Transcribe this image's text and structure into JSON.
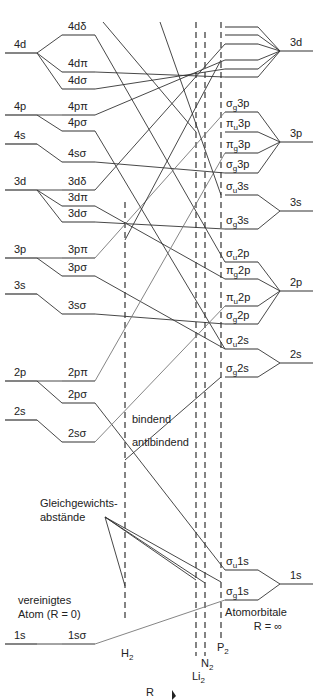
{
  "diagram": {
    "left_header": "vereinigtes Atom (R = 0)",
    "left_header_lines": [
      "vereinigtes",
      "Atom (R = 0)"
    ],
    "right_header_lines": [
      "Atomorbitale",
      "R = ∞"
    ],
    "axis_label": "R",
    "bonding_label": "bindend",
    "antibonding_label": "antibindend",
    "equilibrium_label_lines": [
      "Gleichgewichts-",
      "abstände"
    ],
    "molecules": [
      {
        "name": "H",
        "sub": "2",
        "x": 125,
        "y_top": 202,
        "y_bottom": 622,
        "label_y": 657
      },
      {
        "name": "Li",
        "sub": "2",
        "x": 196,
        "y_top": 22,
        "y_bottom": 656,
        "label_y": 680
      },
      {
        "name": "N",
        "sub": "2",
        "x": 205,
        "y_top": 32,
        "y_bottom": 656,
        "label_y": 667
      },
      {
        "name": "P",
        "sub": "2",
        "x": 221,
        "y_top": 22,
        "y_bottom": 640,
        "label_y": 651
      }
    ],
    "united_atom_levels": [
      {
        "label": "4d",
        "y": 53
      },
      {
        "label": "4p",
        "y": 115
      },
      {
        "label": "4s",
        "y": 144
      },
      {
        "label": "3d",
        "y": 190
      },
      {
        "label": "3p",
        "y": 258
      },
      {
        "label": "3s",
        "y": 294
      },
      {
        "label": "2p",
        "y": 381
      },
      {
        "label": "2s",
        "y": 420
      },
      {
        "label": "1s",
        "y": 644
      }
    ],
    "united_mo_levels": [
      {
        "label": "4dδ",
        "y": 35,
        "parent_y": 53
      },
      {
        "label": "4dπ",
        "y": 72,
        "parent_y": 53
      },
      {
        "label": "4dσ",
        "y": 89,
        "parent_y": 53
      },
      {
        "label": "4pπ",
        "y": 115,
        "parent_y": 115
      },
      {
        "label": "4pσ",
        "y": 131,
        "parent_y": 115
      },
      {
        "label": "4sσ",
        "y": 162,
        "parent_y": 144
      },
      {
        "label": "3dδ",
        "y": 190,
        "parent_y": 190
      },
      {
        "label": "3dπ",
        "y": 206,
        "parent_y": 190
      },
      {
        "label": "3dσ",
        "y": 222,
        "parent_y": 190
      },
      {
        "label": "3pπ",
        "y": 258,
        "parent_y": 258
      },
      {
        "label": "3pσ",
        "y": 276,
        "parent_y": 258
      },
      {
        "label": "3sσ",
        "y": 314,
        "parent_y": 294
      },
      {
        "label": "2pπ",
        "y": 381,
        "parent_y": 381
      },
      {
        "label": "2pσ",
        "y": 403,
        "parent_y": 381
      },
      {
        "label": "2sσ",
        "y": 442,
        "parent_y": 420
      },
      {
        "label": "1sσ",
        "y": 644,
        "parent_y": 644
      }
    ],
    "separated_atom_levels": [
      {
        "label": "3d",
        "y": 51
      },
      {
        "label": "3p",
        "y": 142
      },
      {
        "label": "3s",
        "y": 211
      },
      {
        "label": "2p",
        "y": 291
      },
      {
        "label": "2s",
        "y": 363
      },
      {
        "label": "1s",
        "y": 584
      }
    ],
    "separated_mo_levels": [
      {
        "sym": "",
        "sub": "",
        "orb": "",
        "y": 27,
        "parent_y": 51
      },
      {
        "sym": "",
        "sub": "",
        "orb": "",
        "y": 35,
        "parent_y": 51
      },
      {
        "sym": "",
        "sub": "",
        "orb": "",
        "y": 44,
        "parent_y": 51
      },
      {
        "sym": "",
        "sub": "",
        "orb": "",
        "y": 60,
        "parent_y": 51
      },
      {
        "sym": "",
        "sub": "",
        "orb": "",
        "y": 69,
        "parent_y": 51
      },
      {
        "sym": "",
        "sub": "",
        "orb": "",
        "y": 77,
        "parent_y": 51
      },
      {
        "sym": "σ",
        "sub": "g",
        "orb": "3p",
        "y": 112,
        "parent_y": 142
      },
      {
        "sym": "π",
        "sub": "u",
        "orb": "3p",
        "y": 132,
        "parent_y": 142
      },
      {
        "sym": "π",
        "sub": "g",
        "orb": "3p",
        "y": 153,
        "parent_y": 142
      },
      {
        "sym": "σ",
        "sub": "g",
        "orb": "3p",
        "y": 173,
        "parent_y": 142
      },
      {
        "sym": "σ",
        "sub": "u",
        "orb": "3s",
        "y": 195,
        "parent_y": 211
      },
      {
        "sym": "σ",
        "sub": "g",
        "orb": "3s",
        "y": 229,
        "parent_y": 211
      },
      {
        "sym": "σ",
        "sub": "u",
        "orb": "2p",
        "y": 262,
        "parent_y": 291
      },
      {
        "sym": "π",
        "sub": "g",
        "orb": "2p",
        "y": 279,
        "parent_y": 291
      },
      {
        "sym": "π",
        "sub": "u",
        "orb": "2p",
        "y": 306,
        "parent_y": 291
      },
      {
        "sym": "σ",
        "sub": "g",
        "orb": "2p",
        "y": 324,
        "parent_y": 291
      },
      {
        "sym": "σ",
        "sub": "u",
        "orb": "2s",
        "y": 349,
        "parent_y": 363
      },
      {
        "sym": "σ",
        "sub": "g",
        "orb": "2s",
        "y": 377,
        "parent_y": 363
      },
      {
        "sym": "σ",
        "sub": "u",
        "orb": "1s",
        "y": 570,
        "parent_y": 584
      },
      {
        "sym": "σ",
        "sub": "g",
        "orb": "1s",
        "y": 600,
        "parent_y": 584
      }
    ],
    "correlations": [
      {
        "from_y": 35,
        "to_y": 262,
        "light": false
      },
      {
        "from_y": 72,
        "to_y": 77,
        "light": false
      },
      {
        "from_y": 89,
        "to_y": 69,
        "light": false
      },
      {
        "from_y": 115,
        "to_y": 60,
        "light": false
      },
      {
        "from_y": 131,
        "to_y": 349,
        "light": false
      },
      {
        "from_y": 162,
        "to_y": 173,
        "light": false
      },
      {
        "from_y": 190,
        "to_y": 44,
        "light": false
      },
      {
        "from_y": 206,
        "to_y": 279,
        "light": false
      },
      {
        "from_y": 222,
        "to_y": 229,
        "light": false
      },
      {
        "from_y": 258,
        "to_y": 112,
        "light": true
      },
      {
        "from_y": 276,
        "to_y": 349,
        "light": false
      },
      {
        "from_y": 314,
        "to_y": 324,
        "light": false
      },
      {
        "from_y": 381,
        "to_y": 153,
        "light": true
      },
      {
        "from_y": 403,
        "to_y": 570,
        "light": false
      },
      {
        "from_y": 442,
        "to_y": 306,
        "light": true
      },
      {
        "from_y": 644,
        "to_y": 600,
        "light": true
      }
    ],
    "extra_lines": [
      {
        "x1": 103,
        "y1": 22,
        "x2": 196,
        "y2": 132
      },
      {
        "x1": 160,
        "y1": 22,
        "x2": 221,
        "y2": 195
      },
      {
        "x1": 125,
        "y1": 240,
        "x2": 221,
        "y2": 60
      },
      {
        "x1": 125,
        "y1": 460,
        "x2": 221,
        "y2": 377
      }
    ]
  }
}
